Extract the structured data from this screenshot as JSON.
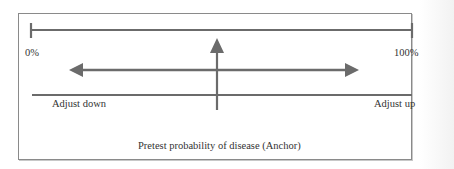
{
  "diagram": {
    "scale": {
      "min_label": "0%",
      "max_label": "100%"
    },
    "adjustment": {
      "left_label": "Adjust down",
      "right_label": "Adjust up"
    },
    "anchor_caption": "Pretest probability of disease (Anchor)",
    "colors": {
      "line": "#6b6b6b",
      "frame": "#8a8a8a",
      "text": "#333333"
    }
  }
}
